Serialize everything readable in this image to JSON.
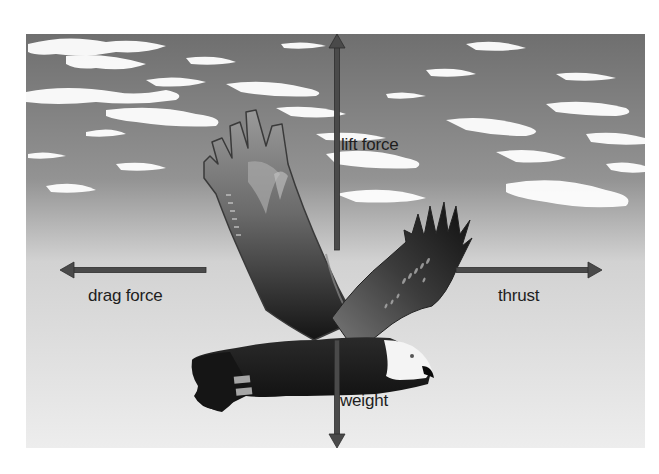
{
  "diagram": {
    "colors": {
      "sky_top": "#6f6f6f",
      "sky_bottom": "#ededed",
      "arrow": "#4a4a4a",
      "label_text": "#1e1e1e",
      "bird_dark": "#1a1a1a",
      "bird_head": "#f4f4f4"
    },
    "forces": [
      {
        "id": "lift",
        "label": "lift force",
        "direction": "up"
      },
      {
        "id": "drag",
        "label": "drag force",
        "direction": "left"
      },
      {
        "id": "thrust",
        "label": "thrust",
        "direction": "right"
      },
      {
        "id": "weight",
        "label": "weight",
        "direction": "down"
      }
    ]
  }
}
